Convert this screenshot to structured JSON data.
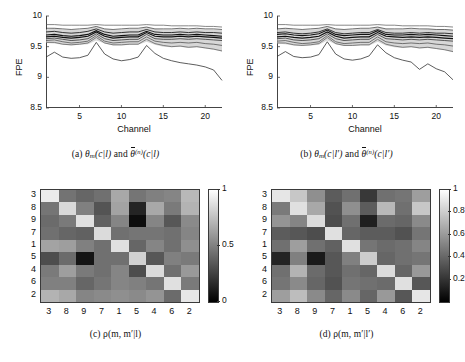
{
  "figure": {
    "panels": [
      "a",
      "b",
      "c",
      "d"
    ]
  },
  "captions": {
    "a_prefix": "(a) ",
    "a_theta": "θ",
    "a_sub": "m",
    "a_arg1": "(c|l)",
    "a_and": " and ",
    "a_theta2": "θ",
    "a_sup": "(n)",
    "a_arg2": "(c|l)",
    "b_prefix": "(b) ",
    "b_theta": "θ",
    "b_sub": "m",
    "b_arg1": "(c|l′)",
    "b_and": " and ",
    "b_theta2": "θ",
    "b_sup": "(n)",
    "b_arg2": "(c|l′)",
    "c_text": "(c)  ρ(m, m′|l)",
    "d_text": "(d) ρ(m, m′|l′)"
  },
  "chart_data": [
    {
      "id": "panel-a",
      "type": "line",
      "title": "",
      "caption": "(a) θ_m(c|l) and θ̄^(n)(c|l)",
      "xlabel": "Channel",
      "ylabel": "FPE",
      "xlim": [
        1,
        22
      ],
      "ylim": [
        8.5,
        10
      ],
      "xticks": [
        5,
        10,
        15,
        20
      ],
      "yticks": [
        "10",
        "9.5",
        "9",
        "8.5"
      ],
      "grid": false,
      "legend": "none",
      "x": [
        1,
        2,
        3,
        4,
        5,
        6,
        7,
        8,
        9,
        10,
        11,
        12,
        13,
        14,
        15,
        16,
        17,
        18,
        19,
        20,
        21,
        22
      ],
      "band": {
        "name": "theta_bar_spread_band",
        "color": "#c9c9c9",
        "upper": [
          9.78,
          9.8,
          9.78,
          9.77,
          9.78,
          9.79,
          9.83,
          9.79,
          9.77,
          9.78,
          9.79,
          9.79,
          9.82,
          9.79,
          9.78,
          9.78,
          9.79,
          9.78,
          9.79,
          9.78,
          9.78,
          9.77
        ],
        "lower": [
          9.56,
          9.55,
          9.53,
          9.52,
          9.53,
          9.54,
          9.6,
          9.55,
          9.52,
          9.52,
          9.53,
          9.53,
          9.58,
          9.53,
          9.5,
          9.49,
          9.5,
          9.48,
          9.49,
          9.47,
          9.45,
          9.42
        ]
      },
      "series": [
        {
          "name": "theta_bar_top",
          "color": "#555",
          "width": 0.7,
          "values": [
            9.86,
            9.86,
            9.85,
            9.85,
            9.85,
            9.85,
            9.86,
            9.85,
            9.85,
            9.85,
            9.85,
            9.85,
            9.86,
            9.85,
            9.85,
            9.84,
            9.84,
            9.84,
            9.84,
            9.83,
            9.83,
            9.82
          ]
        },
        {
          "name": "theta_m_1",
          "color": "#333",
          "width": 0.7,
          "values": [
            9.8,
            9.8,
            9.79,
            9.78,
            9.79,
            9.8,
            9.83,
            9.79,
            9.78,
            9.79,
            9.8,
            9.8,
            9.82,
            9.79,
            9.79,
            9.79,
            9.8,
            9.79,
            9.8,
            9.79,
            9.79,
            9.78
          ]
        },
        {
          "name": "theta_m_2",
          "color": "#222",
          "width": 0.9,
          "values": [
            9.74,
            9.75,
            9.73,
            9.72,
            9.73,
            9.75,
            9.79,
            9.74,
            9.72,
            9.73,
            9.74,
            9.74,
            9.78,
            9.74,
            9.73,
            9.73,
            9.74,
            9.73,
            9.74,
            9.73,
            9.73,
            9.72
          ]
        },
        {
          "name": "theta_m_3",
          "color": "#111",
          "width": 1.1,
          "values": [
            9.69,
            9.7,
            9.68,
            9.67,
            9.68,
            9.7,
            9.76,
            9.7,
            9.67,
            9.68,
            9.69,
            9.69,
            9.75,
            9.7,
            9.69,
            9.69,
            9.7,
            9.69,
            9.7,
            9.69,
            9.68,
            9.67
          ]
        },
        {
          "name": "theta_m_4",
          "color": "#111",
          "width": 1.2,
          "values": [
            9.66,
            9.67,
            9.65,
            9.64,
            9.65,
            9.67,
            9.74,
            9.67,
            9.64,
            9.65,
            9.66,
            9.66,
            9.73,
            9.67,
            9.66,
            9.66,
            9.67,
            9.66,
            9.67,
            9.66,
            9.65,
            9.64
          ]
        },
        {
          "name": "theta_m_5",
          "color": "#333",
          "width": 0.8,
          "values": [
            9.63,
            9.64,
            9.62,
            9.6,
            9.61,
            9.63,
            9.71,
            9.63,
            9.6,
            9.61,
            9.62,
            9.62,
            9.7,
            9.63,
            9.62,
            9.62,
            9.63,
            9.62,
            9.63,
            9.62,
            9.61,
            9.6
          ]
        },
        {
          "name": "theta_m_6",
          "color": "#444",
          "width": 0.7,
          "values": [
            9.6,
            9.61,
            9.58,
            9.56,
            9.57,
            9.59,
            9.68,
            9.59,
            9.56,
            9.57,
            9.58,
            9.58,
            9.66,
            9.59,
            9.57,
            9.56,
            9.57,
            9.56,
            9.57,
            9.55,
            9.54,
            9.52
          ]
        },
        {
          "name": "theta_m_7",
          "color": "#555",
          "width": 0.7,
          "values": [
            9.57,
            9.57,
            9.54,
            9.53,
            9.54,
            9.56,
            9.65,
            9.56,
            9.53,
            9.53,
            9.54,
            9.54,
            9.62,
            9.55,
            9.52,
            9.5,
            9.51,
            9.49,
            9.5,
            9.48,
            9.46,
            9.43
          ]
        },
        {
          "name": "theta_m_low",
          "color": "#333",
          "width": 0.8,
          "values": [
            9.33,
            9.41,
            9.33,
            9.31,
            9.32,
            9.36,
            9.57,
            9.38,
            9.3,
            9.27,
            9.29,
            9.33,
            9.52,
            9.39,
            9.31,
            9.27,
            9.24,
            9.22,
            9.2,
            9.17,
            9.12,
            8.95
          ]
        }
      ]
    },
    {
      "id": "panel-b",
      "type": "line",
      "title": "",
      "caption": "(b) θ_m(c|l′) and θ̄^(n)(c|l′)",
      "xlabel": "Channel",
      "ylabel": "FPE",
      "xlim": [
        1,
        22
      ],
      "ylim": [
        8.5,
        10
      ],
      "xticks": [
        5,
        10,
        15,
        20
      ],
      "yticks": [
        "10",
        "9.5",
        "9",
        "8.5"
      ],
      "grid": false,
      "legend": "none",
      "x": [
        1,
        2,
        3,
        4,
        5,
        6,
        7,
        8,
        9,
        10,
        11,
        12,
        13,
        14,
        15,
        16,
        17,
        18,
        19,
        20,
        21,
        22
      ],
      "band": {
        "name": "theta_bar_spread_band",
        "color": "#c9c9c9",
        "upper": [
          9.78,
          9.8,
          9.78,
          9.77,
          9.78,
          9.79,
          9.83,
          9.79,
          9.77,
          9.78,
          9.79,
          9.79,
          9.82,
          9.79,
          9.78,
          9.78,
          9.79,
          9.78,
          9.79,
          9.78,
          9.78,
          9.77
        ],
        "lower": [
          9.55,
          9.54,
          9.52,
          9.51,
          9.52,
          9.53,
          9.6,
          9.54,
          9.51,
          9.51,
          9.52,
          9.52,
          9.58,
          9.52,
          9.49,
          9.48,
          9.49,
          9.47,
          9.48,
          9.46,
          9.44,
          9.41
        ]
      },
      "series": [
        {
          "name": "theta_bar_top",
          "color": "#555",
          "width": 0.7,
          "values": [
            9.86,
            9.86,
            9.85,
            9.85,
            9.85,
            9.85,
            9.86,
            9.85,
            9.85,
            9.85,
            9.85,
            9.85,
            9.86,
            9.85,
            9.85,
            9.84,
            9.84,
            9.84,
            9.84,
            9.83,
            9.83,
            9.82
          ]
        },
        {
          "name": "theta_m_1",
          "color": "#333",
          "width": 0.7,
          "values": [
            9.79,
            9.8,
            9.79,
            9.78,
            9.79,
            9.8,
            9.83,
            9.79,
            9.78,
            9.79,
            9.8,
            9.8,
            9.82,
            9.79,
            9.79,
            9.79,
            9.8,
            9.79,
            9.79,
            9.78,
            9.78,
            9.77
          ]
        },
        {
          "name": "theta_m_2",
          "color": "#222",
          "width": 0.9,
          "values": [
            9.73,
            9.74,
            9.72,
            9.71,
            9.72,
            9.74,
            9.79,
            9.73,
            9.71,
            9.72,
            9.73,
            9.73,
            9.78,
            9.73,
            9.72,
            9.72,
            9.73,
            9.72,
            9.73,
            9.72,
            9.72,
            9.71
          ]
        },
        {
          "name": "theta_m_3",
          "color": "#111",
          "width": 1.1,
          "values": [
            9.7,
            9.71,
            9.69,
            9.68,
            9.69,
            9.71,
            9.77,
            9.7,
            9.68,
            9.69,
            9.7,
            9.7,
            9.76,
            9.7,
            9.69,
            9.69,
            9.7,
            9.69,
            9.7,
            9.69,
            9.68,
            9.67
          ]
        },
        {
          "name": "theta_m_4",
          "color": "#111",
          "width": 1.2,
          "values": [
            9.66,
            9.67,
            9.65,
            9.64,
            9.65,
            9.67,
            9.74,
            9.67,
            9.64,
            9.65,
            9.66,
            9.66,
            9.73,
            9.67,
            9.66,
            9.65,
            9.66,
            9.65,
            9.66,
            9.65,
            9.64,
            9.63
          ]
        },
        {
          "name": "theta_m_5",
          "color": "#333",
          "width": 0.8,
          "values": [
            9.63,
            9.64,
            9.61,
            9.6,
            9.61,
            9.63,
            9.71,
            9.63,
            9.6,
            9.61,
            9.62,
            9.62,
            9.7,
            9.63,
            9.62,
            9.61,
            9.62,
            9.61,
            9.62,
            9.61,
            9.6,
            9.59
          ]
        },
        {
          "name": "theta_m_6",
          "color": "#444",
          "width": 0.7,
          "values": [
            9.59,
            9.6,
            9.57,
            9.55,
            9.56,
            9.58,
            9.68,
            9.58,
            9.55,
            9.56,
            9.57,
            9.57,
            9.66,
            9.58,
            9.56,
            9.55,
            9.56,
            9.55,
            9.56,
            9.54,
            9.53,
            9.51
          ]
        },
        {
          "name": "theta_m_7",
          "color": "#555",
          "width": 0.7,
          "values": [
            9.56,
            9.56,
            9.53,
            9.52,
            9.53,
            9.55,
            9.65,
            9.55,
            9.52,
            9.52,
            9.53,
            9.53,
            9.62,
            9.54,
            9.51,
            9.49,
            9.5,
            9.48,
            9.49,
            9.47,
            9.45,
            9.42
          ]
        },
        {
          "name": "theta_m_low",
          "color": "#333",
          "width": 0.8,
          "values": [
            9.34,
            9.42,
            9.34,
            9.32,
            9.33,
            9.37,
            9.58,
            9.38,
            9.3,
            9.28,
            9.3,
            9.35,
            9.53,
            9.4,
            9.32,
            9.28,
            9.25,
            9.13,
            9.22,
            9.14,
            9.09,
            8.96
          ]
        }
      ]
    },
    {
      "id": "panel-c",
      "type": "heatmap",
      "title": "",
      "caption": "(c)  ρ(m, m′|l)",
      "xlabel": "",
      "ylabel": "",
      "colormap": "gray",
      "zlim": [
        0,
        1
      ],
      "colorbar_ticks": [
        "1",
        "0.5",
        "0"
      ],
      "row_labels": [
        "3",
        "8",
        "9",
        "7",
        "1",
        "5",
        "4",
        "6",
        "2"
      ],
      "col_labels": [
        "3",
        "8",
        "9",
        "7",
        "1",
        "5",
        "4",
        "6",
        "2"
      ],
      "values": [
        [
          0.92,
          0.45,
          0.4,
          0.44,
          0.66,
          0.46,
          0.5,
          0.52,
          0.72
        ],
        [
          0.46,
          0.85,
          0.5,
          0.33,
          0.64,
          0.14,
          0.66,
          0.48,
          0.7
        ],
        [
          0.42,
          0.48,
          0.88,
          0.38,
          0.52,
          0.05,
          0.52,
          0.34,
          0.54
        ],
        [
          0.44,
          0.4,
          0.38,
          0.86,
          0.44,
          0.46,
          0.46,
          0.44,
          0.52
        ],
        [
          0.64,
          0.62,
          0.5,
          0.44,
          0.88,
          0.4,
          0.52,
          0.44,
          0.56
        ],
        [
          0.3,
          0.42,
          0.08,
          0.44,
          0.44,
          0.82,
          0.34,
          0.5,
          0.48
        ],
        [
          0.48,
          0.62,
          0.48,
          0.44,
          0.52,
          0.3,
          0.86,
          0.44,
          0.6
        ],
        [
          0.5,
          0.5,
          0.4,
          0.46,
          0.52,
          0.5,
          0.46,
          0.88,
          0.48
        ],
        [
          0.7,
          0.66,
          0.52,
          0.54,
          0.56,
          0.54,
          0.58,
          0.42,
          0.9
        ]
      ]
    },
    {
      "id": "panel-d",
      "type": "heatmap",
      "title": "",
      "caption": "(d) ρ(m, m′|l′)",
      "xlabel": "",
      "ylabel": "",
      "colormap": "gray",
      "zlim": [
        0,
        1
      ],
      "colorbar_ticks": [
        "1",
        "0.8",
        "0.6",
        "0.4",
        "0.2"
      ],
      "row_labels": [
        "3",
        "8",
        "9",
        "7",
        "1",
        "5",
        "4",
        "6",
        "2"
      ],
      "col_labels": [
        "3",
        "8",
        "9",
        "7",
        "1",
        "5",
        "4",
        "6",
        "2"
      ],
      "values": [
        [
          0.9,
          0.78,
          0.56,
          0.36,
          0.44,
          0.22,
          0.44,
          0.46,
          0.62
        ],
        [
          0.48,
          0.88,
          0.66,
          0.32,
          0.56,
          0.36,
          0.72,
          0.44,
          0.78
        ],
        [
          0.58,
          0.52,
          0.86,
          0.3,
          0.44,
          0.12,
          0.42,
          0.4,
          0.54
        ],
        [
          0.36,
          0.34,
          0.3,
          0.88,
          0.4,
          0.36,
          0.36,
          0.32,
          0.46
        ],
        [
          0.44,
          0.62,
          0.44,
          0.38,
          0.88,
          0.46,
          0.42,
          0.44,
          0.52
        ],
        [
          0.14,
          0.5,
          0.1,
          0.34,
          0.5,
          0.8,
          0.4,
          0.44,
          0.46
        ],
        [
          0.44,
          0.7,
          0.42,
          0.34,
          0.44,
          0.4,
          0.86,
          0.4,
          0.6
        ],
        [
          0.46,
          0.54,
          0.4,
          0.32,
          0.46,
          0.44,
          0.42,
          0.88,
          0.34
        ],
        [
          0.62,
          0.74,
          0.54,
          0.4,
          0.54,
          0.4,
          0.6,
          0.34,
          0.9
        ]
      ]
    }
  ]
}
